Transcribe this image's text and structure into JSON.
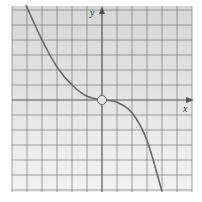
{
  "chart_data": {
    "type": "line",
    "title": "",
    "xlabel": "x",
    "ylabel": "y",
    "xlim": [
      -6,
      6
    ],
    "ylim": [
      -6,
      6
    ],
    "grid": true,
    "grid_step": 1,
    "tick_labels_shown": false,
    "series": [
      {
        "name": "left-branch",
        "points": [
          [
            -5.07,
            6.33
          ],
          [
            -4,
            4.0
          ],
          [
            -3,
            2.2
          ],
          [
            -2,
            1.0
          ],
          [
            -1,
            0.25
          ],
          [
            0,
            0
          ]
        ]
      },
      {
        "name": "right-branch",
        "points": [
          [
            0,
            0
          ],
          [
            1,
            -0.15
          ],
          [
            2,
            -0.85
          ],
          [
            3,
            -2.7
          ],
          [
            4,
            -6.1
          ]
        ]
      }
    ],
    "annotations": [
      {
        "type": "open-circle",
        "at": [
          0,
          0
        ],
        "description": "hole at origin"
      }
    ],
    "colors": {
      "background_top": "#d6d6d6",
      "background_bottom": "#f2f2f2",
      "grid": "#707070",
      "axis": "#555555",
      "curve": "#666666"
    }
  }
}
